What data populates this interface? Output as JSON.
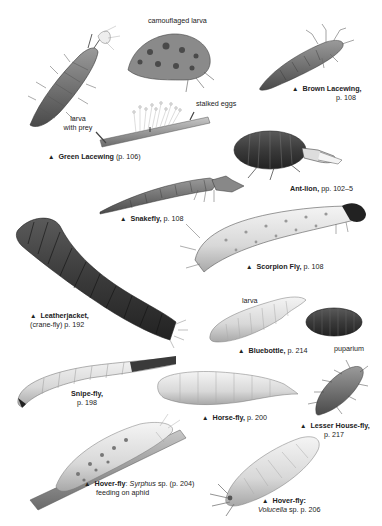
{
  "page": {
    "marker_glyph": "▲"
  },
  "labels": {
    "camouflaged_larva": "camouflaged larva",
    "larva_with_prey_1": "larva",
    "larva_with_prey_2": "with prey",
    "stalked_eggs": "stalked eggs",
    "green_lacewing": {
      "name": "Green Lacewing",
      "ref": " (p. 106)"
    },
    "brown_lacewing": {
      "name": "Brown Lacewing,",
      "ref": "p. 108"
    },
    "ant_lion": {
      "name": "Ant-lion,",
      "ref": " pp. 102–5"
    },
    "snakefly": {
      "name": "Snakefly,",
      "ref": " p. 108"
    },
    "scorpion_fly": {
      "name": "Scorpion Fly,",
      "ref": " p. 108"
    },
    "leatherjacket": {
      "name": "Leatherjacket,",
      "ref": "(crane-fly) p. 192"
    },
    "bluebottle": {
      "name": "Bluebottle,",
      "ref": " p. 214",
      "larva": "larva",
      "puparium": "puparium"
    },
    "snipe_fly": {
      "name": "Snipe-fly,",
      "ref": "p. 198"
    },
    "horse_fly": {
      "name": "Horse-fly,",
      "ref": " p. 200"
    },
    "lesser_house_fly": {
      "name": "Lesser House-fly,",
      "ref": "p. 217"
    },
    "hover_fly_syrphus": {
      "name": "Hover-fly",
      "sep": ": ",
      "genus": "Syrphus",
      "ref": " sp. (p. 204)",
      "note": "feeding on aphid"
    },
    "hover_fly_volucella": {
      "name": "Hover-fly:",
      "genus": "Volucella",
      "ref": " sp. p. 206"
    }
  }
}
